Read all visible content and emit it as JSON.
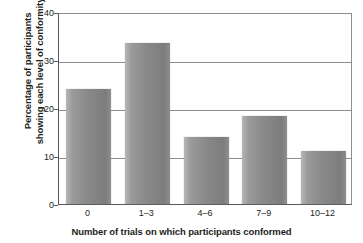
{
  "chart_data": {
    "type": "bar",
    "title": "",
    "categories": [
      "0",
      "1–3",
      "4–6",
      "7–9",
      "10–12"
    ],
    "values": [
      24.0,
      33.5,
      14.0,
      18.3,
      11.0
    ],
    "xlabel": "Number of trials on which participants conformed",
    "ylabel": "Percentage of participants showing each level of conformity",
    "ylabel_line1": "Percentage of participants",
    "ylabel_line2": "showing each level of conformity",
    "ylim": [
      0,
      40
    ],
    "yticks": [
      "0",
      "10",
      "20",
      "30",
      "40"
    ],
    "ytick_values": [
      0,
      10,
      20,
      30,
      40
    ],
    "grid": "horizontal",
    "legend": "none",
    "bar_color": "#8a8a8a",
    "axis_color": "#58595b",
    "grid_color": "#8e8e8e",
    "text_color": "#231f20"
  }
}
